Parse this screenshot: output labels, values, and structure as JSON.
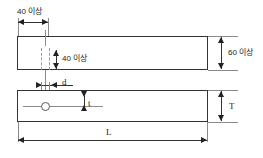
{
  "diagram": {
    "views": [
      {
        "name": "top-view",
        "shape": "rectangle"
      },
      {
        "name": "side-view",
        "shape": "rectangle-with-hole"
      }
    ],
    "labels": {
      "edge_distance_horizontal": "40 이상",
      "edge_distance_vertical": "40 이상",
      "width": "60 이상",
      "hole_diameter": "d",
      "notch_thickness": "t",
      "plate_thickness": "T",
      "length": "L"
    },
    "colors": {
      "outline": "#333333",
      "dimension": "#222222",
      "centerline": "#8a8a8a",
      "hidden": "#9a9a9a",
      "background": "#ffffff",
      "text": "#1a1a1a"
    }
  }
}
